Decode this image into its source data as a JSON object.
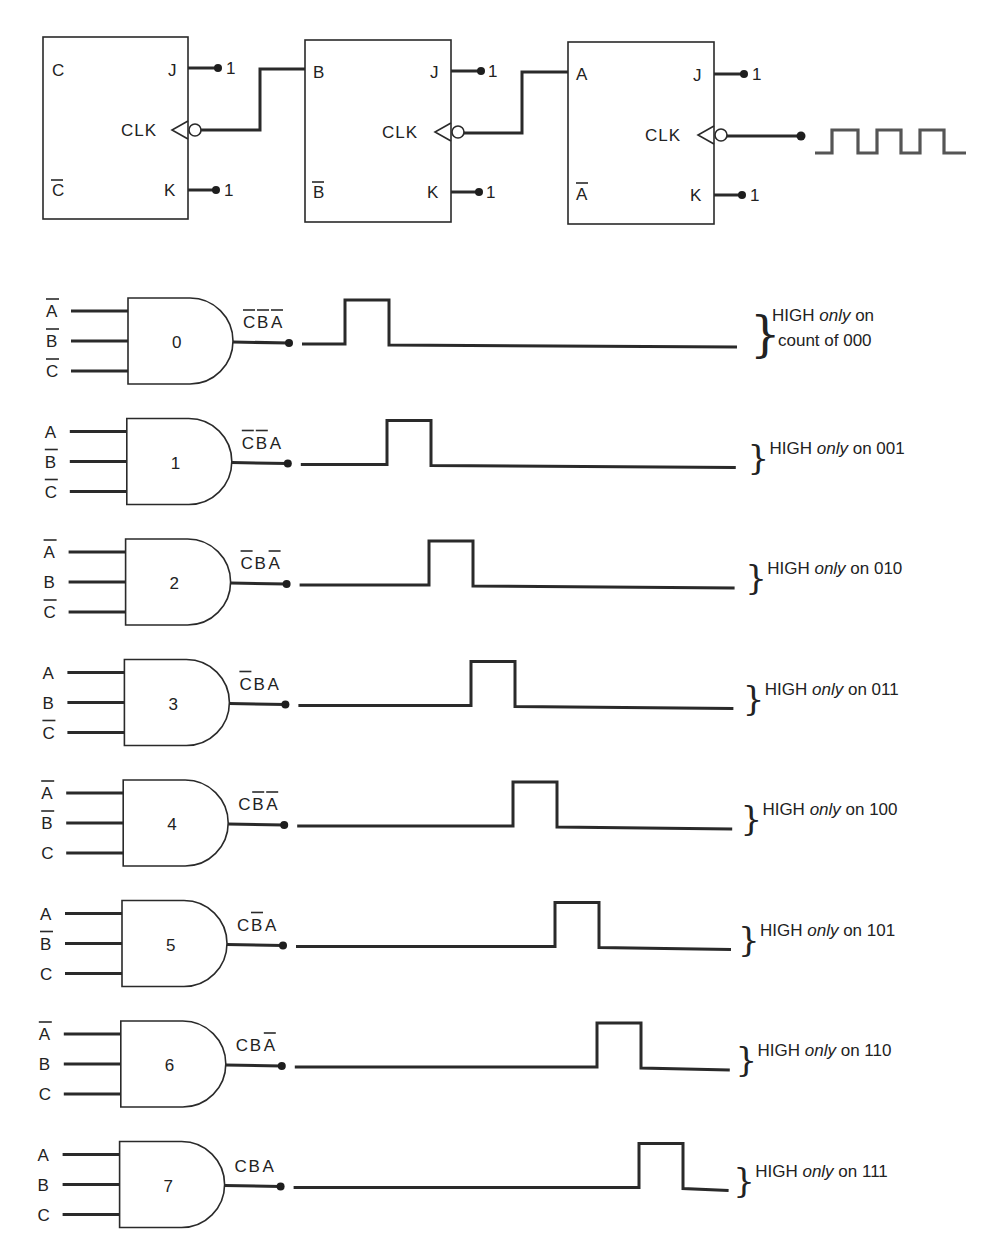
{
  "counter": {
    "flipflops": [
      {
        "id": "ff-c",
        "q": "C",
        "q_bar": "C",
        "j": "J",
        "k": "K",
        "clk": "CLK",
        "j_tie": "1",
        "k_tie": "1"
      },
      {
        "id": "ff-b",
        "q": "B",
        "q_bar": "B",
        "j": "J",
        "k": "K",
        "clk": "CLK",
        "j_tie": "1",
        "k_tie": "1"
      },
      {
        "id": "ff-a",
        "q": "A",
        "q_bar": "A",
        "j": "J",
        "k": "K",
        "clk": "CLK",
        "j_tie": "1",
        "k_tie": "1"
      }
    ],
    "clock_input": {
      "waveform": "square",
      "pulses": 3
    }
  },
  "decoder": {
    "gates": [
      {
        "number": "0",
        "inputs": [
          {
            "name": "A",
            "bar": true
          },
          {
            "name": "B",
            "bar": true
          },
          {
            "name": "C",
            "bar": true
          }
        ],
        "output": [
          {
            "name": "C",
            "bar": true
          },
          {
            "name": "B",
            "bar": true
          },
          {
            "name": "A",
            "bar": true
          }
        ],
        "note_main": "HIGH ",
        "note_italic": "only",
        "note_tail": " on",
        "note_line2": "count of 000",
        "pulse_slot": 0
      },
      {
        "number": "1",
        "inputs": [
          {
            "name": "A",
            "bar": false
          },
          {
            "name": "B",
            "bar": true
          },
          {
            "name": "C",
            "bar": true
          }
        ],
        "output": [
          {
            "name": "C",
            "bar": true
          },
          {
            "name": "B",
            "bar": true
          },
          {
            "name": "A",
            "bar": false
          }
        ],
        "note_main": "HIGH ",
        "note_italic": "only",
        "note_tail": " on 001",
        "note_line2": "",
        "pulse_slot": 1
      },
      {
        "number": "2",
        "inputs": [
          {
            "name": "A",
            "bar": true
          },
          {
            "name": "B",
            "bar": false
          },
          {
            "name": "C",
            "bar": true
          }
        ],
        "output": [
          {
            "name": "C",
            "bar": true
          },
          {
            "name": "B",
            "bar": false
          },
          {
            "name": "A",
            "bar": true
          }
        ],
        "note_main": "HIGH ",
        "note_italic": "only",
        "note_tail": " on 010",
        "note_line2": "",
        "pulse_slot": 2
      },
      {
        "number": "3",
        "inputs": [
          {
            "name": "A",
            "bar": false
          },
          {
            "name": "B",
            "bar": false
          },
          {
            "name": "C",
            "bar": true
          }
        ],
        "output": [
          {
            "name": "C",
            "bar": true
          },
          {
            "name": "B",
            "bar": false
          },
          {
            "name": "A",
            "bar": false
          }
        ],
        "note_main": "HIGH ",
        "note_italic": "only",
        "note_tail": " on 011",
        "note_line2": "",
        "pulse_slot": 3
      },
      {
        "number": "4",
        "inputs": [
          {
            "name": "A",
            "bar": true
          },
          {
            "name": "B",
            "bar": true
          },
          {
            "name": "C",
            "bar": false
          }
        ],
        "output": [
          {
            "name": "C",
            "bar": false
          },
          {
            "name": "B",
            "bar": true
          },
          {
            "name": "A",
            "bar": true
          }
        ],
        "note_main": "HIGH ",
        "note_italic": "only",
        "note_tail": " on 100",
        "note_line2": "",
        "pulse_slot": 4
      },
      {
        "number": "5",
        "inputs": [
          {
            "name": "A",
            "bar": false
          },
          {
            "name": "B",
            "bar": true
          },
          {
            "name": "C",
            "bar": false
          }
        ],
        "output": [
          {
            "name": "C",
            "bar": false
          },
          {
            "name": "B",
            "bar": true
          },
          {
            "name": "A",
            "bar": false
          }
        ],
        "note_main": "HIGH ",
        "note_italic": "only",
        "note_tail": " on 101",
        "note_line2": "",
        "pulse_slot": 5
      },
      {
        "number": "6",
        "inputs": [
          {
            "name": "A",
            "bar": true
          },
          {
            "name": "B",
            "bar": false
          },
          {
            "name": "C",
            "bar": false
          }
        ],
        "output": [
          {
            "name": "C",
            "bar": false
          },
          {
            "name": "B",
            "bar": false
          },
          {
            "name": "A",
            "bar": true
          }
        ],
        "note_main": "HIGH ",
        "note_italic": "only",
        "note_tail": " on 110",
        "note_line2": "",
        "pulse_slot": 6
      },
      {
        "number": "7",
        "inputs": [
          {
            "name": "A",
            "bar": false
          },
          {
            "name": "B",
            "bar": false
          },
          {
            "name": "C",
            "bar": false
          }
        ],
        "output": [
          {
            "name": "C",
            "bar": false
          },
          {
            "name": "B",
            "bar": false
          },
          {
            "name": "A",
            "bar": false
          }
        ],
        "note_main": "HIGH ",
        "note_italic": "only",
        "note_tail": " on 111",
        "note_line2": "",
        "pulse_slot": 7
      }
    ]
  },
  "colors": {
    "ink": "#222222",
    "background": "#ffffff",
    "clock_wave": "#555555"
  }
}
